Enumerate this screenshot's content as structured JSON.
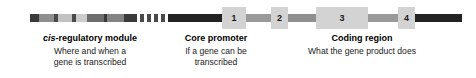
{
  "figure": {
    "name": "gene-structure-diagram",
    "colors": {
      "dark": "#2b2b2b",
      "mid_dark": "#555555",
      "mid": "#777777",
      "mid_light": "#9a9a9a",
      "light": "#b8b8b8",
      "very_light": "#cfcfcf",
      "exon_fill": "#d3d3d3",
      "background": "#ffffff",
      "text": "#000000"
    },
    "bar": {
      "segments": [
        {
          "name": "cis-segment-1",
          "left": 30,
          "width": 9,
          "color": "#3a3a3a"
        },
        {
          "name": "cis-segment-2",
          "left": 39,
          "width": 15,
          "color": "#8e8e8e"
        },
        {
          "name": "cis-segment-3",
          "left": 54,
          "width": 4,
          "color": "#4a4a4a"
        },
        {
          "name": "cis-segment-4",
          "left": 58,
          "width": 14,
          "color": "#c2c2c2"
        },
        {
          "name": "cis-segment-5",
          "left": 72,
          "width": 4,
          "color": "#4a4a4a"
        },
        {
          "name": "cis-segment-6",
          "left": 76,
          "width": 11,
          "color": "#cccccc"
        },
        {
          "name": "cis-segment-7",
          "left": 87,
          "width": 17,
          "color": "#6e6e6e"
        },
        {
          "name": "cis-segment-8",
          "left": 104,
          "width": 3,
          "color": "#3a3a3a"
        },
        {
          "name": "cis-segment-9",
          "left": 107,
          "width": 17,
          "color": "#838383"
        },
        {
          "name": "cis-segment-10",
          "left": 124,
          "width": 13,
          "color": "#3a3a3a"
        }
      ],
      "ticks": [
        {
          "name": "intergenic-tick-1",
          "left": 140,
          "width": 4,
          "color": "#4a4a4a"
        },
        {
          "name": "intergenic-tick-2",
          "left": 147,
          "width": 4,
          "color": "#4a4a4a"
        },
        {
          "name": "intergenic-tick-3",
          "left": 154,
          "width": 4,
          "color": "#4a4a4a"
        },
        {
          "name": "intergenic-tick-4",
          "left": 161,
          "width": 4,
          "color": "#4a4a4a"
        }
      ],
      "core_promoter": {
        "name": "core-promoter-segment",
        "left": 168,
        "width": 54,
        "color": "#232323"
      },
      "introns": [
        {
          "name": "intron-segment-1",
          "left": 246,
          "width": 25,
          "color": "#9a9a9a"
        },
        {
          "name": "intron-segment-2",
          "left": 288,
          "width": 28,
          "color": "#8f8f8f"
        },
        {
          "name": "intron-segment-3",
          "left": 368,
          "width": 30,
          "color": "#9a9a9a"
        }
      ],
      "terminal": {
        "name": "terminal-segment",
        "left": 415,
        "width": 47,
        "color": "#232323"
      },
      "exons": [
        {
          "name": "exon-box-1",
          "label": "1",
          "left": 222,
          "width": 24
        },
        {
          "name": "exon-box-2",
          "label": "2",
          "left": 271,
          "width": 17
        },
        {
          "name": "exon-box-3",
          "label": "3",
          "left": 316,
          "width": 52
        },
        {
          "name": "exon-box-4",
          "label": "4",
          "left": 398,
          "width": 17
        }
      ]
    },
    "captions": [
      {
        "name": "caption-cis-regulatory-module",
        "title_italic": "cis",
        "title_rest": "-regulatory module",
        "lines": [
          "Where and when a",
          "gene is transcribed"
        ],
        "left": 10,
        "width": 160
      },
      {
        "name": "caption-core-promoter",
        "title_italic": "",
        "title_rest": "Core promoter",
        "lines": [
          "If a gene can be",
          "transcribed"
        ],
        "left": 160,
        "width": 112
      },
      {
        "name": "caption-coding-region",
        "title_italic": "",
        "title_rest": "Coding region",
        "lines": [
          "What the gene product does"
        ],
        "left": 262,
        "width": 200
      }
    ]
  }
}
